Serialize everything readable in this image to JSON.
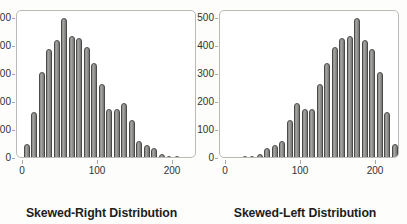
{
  "figure": {
    "background_color": "#fdfdfc",
    "bar_color": "#8d8d8b",
    "bar_edge_color": "#4a4a48",
    "axis_color": "#b9b9b6",
    "text_color": "#30302f"
  },
  "chart_data": [
    {
      "type": "bar",
      "title": "Skewed-Right Distribution",
      "xlabel": "Skewed-Right Distribution",
      "ylabel": "Frequency",
      "xlim": [
        -8,
        232
      ],
      "ylim": [
        0,
        530
      ],
      "grid": false,
      "legend": null,
      "xticks": [
        0,
        100,
        200
      ],
      "xticklabels": [
        "0",
        "100",
        "200"
      ],
      "yticks": [
        0,
        100,
        200,
        300,
        400,
        500
      ],
      "yticklabels": [
        "0",
        "100",
        "200",
        "300",
        "400",
        "500"
      ],
      "bin_width": 10,
      "x": [
        5,
        15,
        25,
        35,
        45,
        55,
        65,
        75,
        85,
        95,
        105,
        115,
        125,
        135,
        145,
        155,
        165,
        175,
        185,
        195,
        205,
        215,
        225
      ],
      "values": [
        55,
        170,
        310,
        395,
        425,
        505,
        440,
        435,
        400,
        345,
        270,
        180,
        180,
        200,
        140,
        65,
        50,
        40,
        18,
        12,
        10,
        8,
        8
      ]
    },
    {
      "type": "bar",
      "title": "Skewed-Left Distribution",
      "xlabel": "Skewed-Left Distribution",
      "ylabel": "Frequency",
      "xlim": [
        -8,
        232
      ],
      "ylim": [
        0,
        530
      ],
      "grid": false,
      "legend": null,
      "xticks": [
        0,
        100,
        200
      ],
      "xticklabels": [
        "0",
        "100",
        "200"
      ],
      "yticks": [
        0,
        100,
        200,
        300,
        400,
        500
      ],
      "yticklabels": [
        "0",
        "100",
        "200",
        "300",
        "400",
        "500"
      ],
      "bin_width": 10,
      "x": [
        5,
        15,
        25,
        35,
        45,
        55,
        65,
        75,
        85,
        95,
        105,
        115,
        125,
        135,
        145,
        155,
        165,
        175,
        185,
        195,
        205,
        215,
        225
      ],
      "values": [
        8,
        8,
        10,
        12,
        18,
        40,
        50,
        65,
        140,
        200,
        180,
        180,
        270,
        345,
        400,
        435,
        440,
        505,
        425,
        395,
        310,
        170,
        55
      ]
    }
  ]
}
